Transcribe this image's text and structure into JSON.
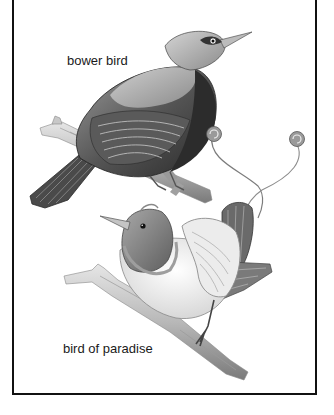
{
  "figure": {
    "labels": {
      "bower_bird": "bower bird",
      "bird_of_paradise": "bird of paradise"
    },
    "style": "grayscale pencil illustration",
    "colors": {
      "border": "#111111",
      "background": "#ffffff",
      "label_text": "#1a1a1a"
    }
  }
}
